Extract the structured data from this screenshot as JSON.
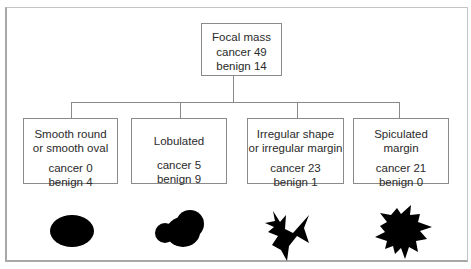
{
  "root": {
    "title": "Focal mass",
    "cancer_label": "cancer 49",
    "benign_label": "benign 14",
    "cancer": 49,
    "benign": 14
  },
  "categories": [
    {
      "title_line1": "Smooth round",
      "title_line2": "or smooth oval",
      "cancer_label": "cancer 0",
      "benign_label": "benign 4",
      "cancer": 0,
      "benign": 4,
      "shape": "oval-shape"
    },
    {
      "title_line1": "Lobulated",
      "title_line2": "",
      "cancer_label": "cancer 5",
      "benign_label": "benign 9",
      "cancer": 5,
      "benign": 9,
      "shape": "lobulated-shape"
    },
    {
      "title_line1": "Irregular shape",
      "title_line2": "or irregular margin",
      "cancer_label": "cancer 23",
      "benign_label": "benign 1",
      "cancer": 23,
      "benign": 1,
      "shape": "irregular-shape"
    },
    {
      "title_line1": "Spiculated",
      "title_line2": "margin",
      "cancer_label": "cancer 21",
      "benign_label": "benign 0",
      "cancer": 21,
      "benign": 0,
      "shape": "spiculated-shape"
    }
  ],
  "colors": {
    "line": "#8a8a8a",
    "shape_fill": "#000000",
    "frame": "#a8a8a8"
  }
}
